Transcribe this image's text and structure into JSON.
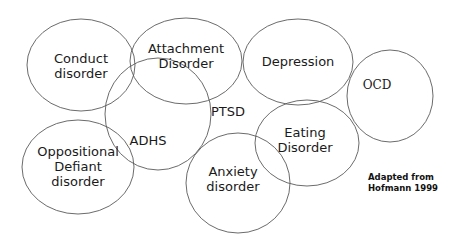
{
  "diagram": {
    "stroke_color": "#5a5a5a",
    "text_color": "#1a1a1a",
    "background_color": "#ffffff",
    "nodes": [
      {
        "id": "conduct-disorder",
        "lines": [
          "Conduct",
          "disorder"
        ],
        "cx": 81,
        "cy": 65,
        "rx": 54,
        "ry": 46,
        "label_x": 81,
        "label_y": 59,
        "font": "sans"
      },
      {
        "id": "attachment-disorder",
        "lines": [
          "Attachment",
          "Disorder"
        ],
        "cx": 186,
        "cy": 61,
        "rx": 56,
        "ry": 43,
        "label_x": 186,
        "label_y": 49,
        "font": "sans"
      },
      {
        "id": "depression",
        "lines": [
          "Depression"
        ],
        "cx": 298,
        "cy": 62,
        "rx": 55,
        "ry": 43,
        "label_x": 298,
        "label_y": 62,
        "font": "sans"
      },
      {
        "id": "ocd",
        "lines": [
          "OCD"
        ],
        "cx": 390,
        "cy": 96,
        "rx": 43,
        "ry": 46,
        "label_x": 377,
        "label_y": 85,
        "font": "serif"
      },
      {
        "id": "adhs",
        "lines": [
          "ADHS"
        ],
        "cx": 158,
        "cy": 114,
        "rx": 53,
        "ry": 56,
        "label_x": 148,
        "label_y": 141,
        "font": "sans"
      },
      {
        "id": "ptsd",
        "lines": [
          "PTSD"
        ],
        "cx": 228,
        "cy": 112,
        "rx": 0,
        "ry": 0,
        "label_x": 228,
        "label_y": 112,
        "font": "sans"
      },
      {
        "id": "oppositional-defiant-disorder",
        "lines": [
          "Oppositional",
          "Defiant",
          "disorder"
        ],
        "cx": 78,
        "cy": 167,
        "rx": 56,
        "ry": 47,
        "label_x": 78,
        "label_y": 152,
        "font": "sans"
      },
      {
        "id": "anxiety-disorder",
        "lines": [
          "Anxiety",
          "disorder"
        ],
        "cx": 238,
        "cy": 183,
        "rx": 52,
        "ry": 50,
        "label_x": 233,
        "label_y": 172,
        "font": "sans"
      },
      {
        "id": "eating-disorder",
        "lines": [
          "Eating",
          "Disorder"
        ],
        "cx": 307,
        "cy": 143,
        "rx": 52,
        "ry": 43,
        "label_x": 305,
        "label_y": 133,
        "font": "sans"
      }
    ],
    "credit": {
      "lines": [
        "Adapted from",
        "Hofmann 1999"
      ],
      "x": 368,
      "y": 177
    }
  }
}
